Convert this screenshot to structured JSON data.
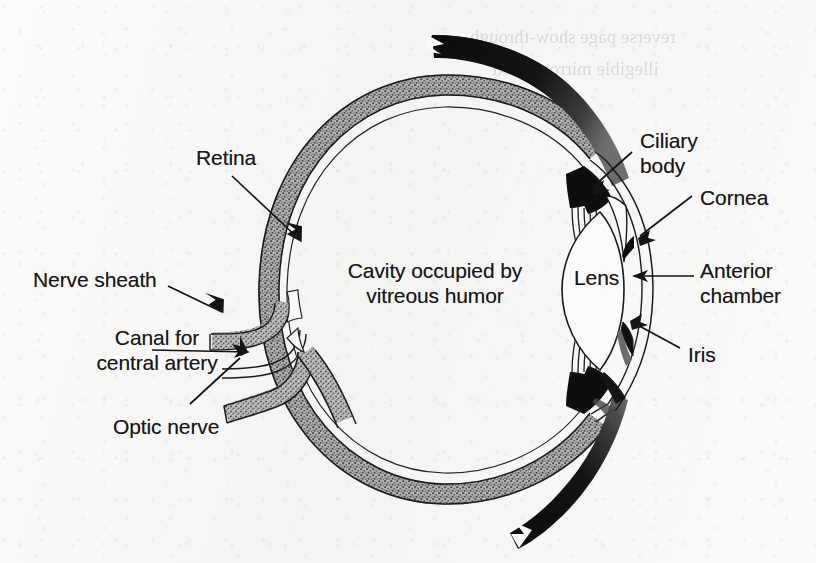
{
  "figure": {
    "medium": "scanned textbook halftone illustration",
    "background_color": "#f7f7f5",
    "ink_color": "#18181a",
    "tissue_fill_color": "#8c8c8c",
    "dark_fill_color": "#101010"
  },
  "labels": {
    "retina": "Retina",
    "nerve_sheath": "Nerve sheath",
    "canal_line1": "Canal for",
    "canal_line2": "central artery",
    "optic_nerve": "Optic nerve",
    "cavity_line1": "Cavity occupied by",
    "cavity_line2": "vitreous humor",
    "ciliary_line1": "Ciliary",
    "ciliary_line2": "body",
    "cornea": "Cornea",
    "lens": "Lens",
    "anterior_line1": "Anterior",
    "anterior_line2": "chamber",
    "iris": "Iris"
  },
  "bleed_through": {
    "note": "faint mirrored show-through text from the reverse of the page, illegible",
    "line1": "reverse page show-through",
    "line2": "illegible mirrored text"
  },
  "structures": [
    {
      "name": "retina",
      "label": "Retina",
      "side": "posterior-superior",
      "rendering": "stippled gray band"
    },
    {
      "name": "nerve-sheath",
      "label": "Nerve sheath",
      "side": "posterior",
      "rendering": "stippled gray band"
    },
    {
      "name": "canal-for-central-artery",
      "label": "Canal for central artery",
      "side": "posterior",
      "rendering": "thin outlined channel"
    },
    {
      "name": "optic-nerve",
      "label": "Optic nerve",
      "side": "posterior",
      "rendering": "stippled gray stalk"
    },
    {
      "name": "vitreous-cavity",
      "label": "Cavity occupied by vitreous humor",
      "side": "center",
      "rendering": "empty white interior"
    },
    {
      "name": "ciliary-body",
      "label": "Ciliary body",
      "side": "anterior",
      "rendering": "solid black wedge"
    },
    {
      "name": "cornea",
      "label": "Cornea",
      "side": "anterior",
      "rendering": "thin double arc"
    },
    {
      "name": "lens",
      "label": "Lens",
      "side": "anterior",
      "rendering": "biconvex outline"
    },
    {
      "name": "anterior-chamber",
      "label": "Anterior chamber",
      "side": "anterior",
      "rendering": "space between cornea and iris"
    },
    {
      "name": "iris",
      "label": "Iris",
      "side": "anterior",
      "rendering": "short dark flap"
    }
  ],
  "label_positions": {
    "retina": {
      "x": 196,
      "y": 146
    },
    "nerve_sheath": {
      "x": 33,
      "y": 268
    },
    "canal": {
      "x": 72,
      "y": 336
    },
    "optic_nerve": {
      "x": 113,
      "y": 415
    },
    "cavity": {
      "x": 345,
      "y": 258
    },
    "ciliary": {
      "x": 640,
      "y": 128
    },
    "cornea": {
      "x": 700,
      "y": 186
    },
    "lens": {
      "x": 576,
      "y": 266
    },
    "anterior": {
      "x": 700,
      "y": 258
    },
    "iris": {
      "x": 688,
      "y": 343
    }
  }
}
